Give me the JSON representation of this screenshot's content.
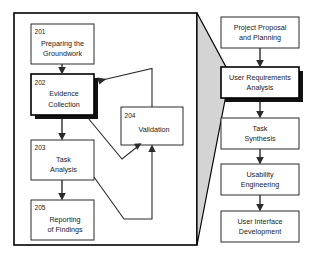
{
  "diagram": {
    "left_panel": {
      "name": "methodology-panel",
      "nodes": [
        {
          "id": "201",
          "line1": "Preparing the",
          "line2": "Groundwork",
          "emphasis": false
        },
        {
          "id": "202",
          "line1": "Evidence",
          "line2": "Collection",
          "emphasis": true
        },
        {
          "id": "203",
          "line1": "Task",
          "line2": "Analysis",
          "emphasis": false
        },
        {
          "id": "204",
          "line1": "Validation",
          "line2": "",
          "emphasis": false
        },
        {
          "id": "205",
          "line1": "Reporting",
          "line2": "of Findings",
          "emphasis": false
        }
      ]
    },
    "right_panel": {
      "name": "lifecycle-panel",
      "nodes": [
        {
          "line1": "Project Proposal",
          "line2": "and Planning",
          "emphasis": false
        },
        {
          "line1": "User Requirements",
          "line2": "Analysis",
          "emphasis": true
        },
        {
          "line1": "Task",
          "line2": "Synthesis",
          "emphasis": false
        },
        {
          "line1": "Usability",
          "line2": "Engineering",
          "emphasis": false
        },
        {
          "line1": "User Interface",
          "line2": "Development",
          "emphasis": false
        }
      ]
    },
    "connector": {
      "name": "expansion-wedge",
      "label": ""
    },
    "colors": {
      "background": "#ffffff",
      "box_fill": "#ffffff",
      "box_stroke": "#2b2b2b",
      "shadow": "#111111",
      "wedge_fill": "#d4d4d4",
      "frame": "#000000",
      "text": "#1a1a1a"
    }
  }
}
